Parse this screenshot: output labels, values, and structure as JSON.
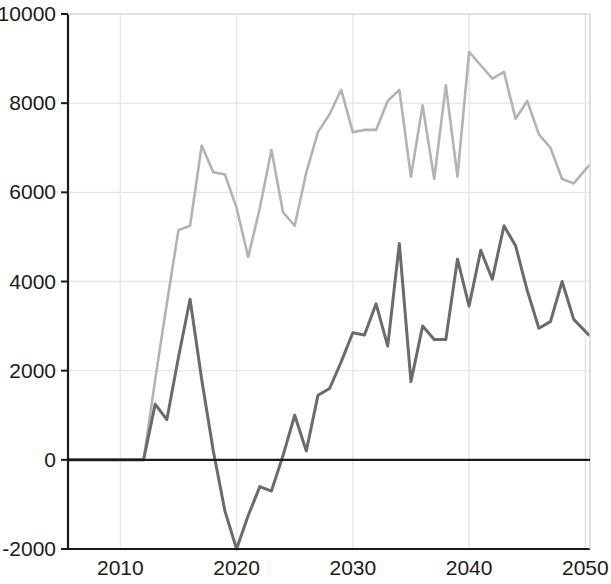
{
  "chart_data": {
    "type": "line",
    "title": "",
    "subtitle": "",
    "xlabel": "",
    "ylabel": "",
    "xlim": [
      2005.5,
      2050.4
    ],
    "ylim": [
      -2000,
      10000
    ],
    "grid": true,
    "legend": "none",
    "x_ticks": [
      "2010",
      "2020",
      "2030",
      "2040",
      "2050"
    ],
    "x_tick_values": [
      2010,
      2020,
      2030,
      2040,
      2050
    ],
    "y_ticks": [
      "10000",
      "8000",
      "6000",
      "4000",
      "2000",
      "0",
      "-2000"
    ],
    "y_tick_values": [
      10000,
      8000,
      6000,
      4000,
      2000,
      0,
      -2000
    ],
    "colors": {
      "upper_series": "#b3b3b3",
      "lower_series": "#6b6b6b",
      "axis": "#1a1a1a",
      "grid": "#e6e6e6",
      "background": "#ffffff"
    },
    "series": [
      {
        "name": "upper-series",
        "color": "#b3b3b3",
        "line_width": 2.6,
        "x": [
          2005.5,
          2006,
          2007,
          2008,
          2009,
          2010,
          2011,
          2012,
          2013,
          2014,
          2015,
          2016,
          2017,
          2018,
          2019,
          2020,
          2021,
          2022,
          2023,
          2024,
          2025,
          2026,
          2027,
          2028,
          2029,
          2030,
          2031,
          2032,
          2033,
          2034,
          2035,
          2036,
          2037,
          2038,
          2039,
          2040,
          2041,
          2042,
          2043,
          2044,
          2045,
          2046,
          2047,
          2048,
          2049,
          2050.3
        ],
        "values": [
          0,
          0,
          0,
          0,
          0,
          0,
          0,
          0,
          1800,
          3500,
          5150,
          5250,
          7050,
          6450,
          6400,
          5650,
          4550,
          5650,
          6950,
          5550,
          5250,
          6450,
          7350,
          7750,
          8300,
          7350,
          7400,
          7400,
          8050,
          8300,
          6350,
          7950,
          6300,
          8400,
          6350,
          9150,
          8850,
          8550,
          8700,
          7650,
          8050,
          7300,
          7000,
          6300,
          6200,
          6600
        ]
      },
      {
        "name": "lower-series",
        "color": "#6b6b6b",
        "line_width": 3.0,
        "x": [
          2005.5,
          2006,
          2007,
          2008,
          2009,
          2010,
          2011,
          2012,
          2013,
          2014,
          2015,
          2016,
          2017,
          2018,
          2019,
          2020,
          2021,
          2022,
          2023,
          2024,
          2025,
          2026,
          2027,
          2028,
          2029,
          2030,
          2031,
          2032,
          2033,
          2034,
          2035,
          2036,
          2037,
          2038,
          2039,
          2040,
          2041,
          2042,
          2043,
          2044,
          2045,
          2046,
          2047,
          2048,
          2049,
          2050.3
        ],
        "values": [
          0,
          0,
          0,
          0,
          0,
          0,
          0,
          0,
          1250,
          900,
          2300,
          3600,
          1800,
          200,
          -1150,
          -2000,
          -1250,
          -600,
          -700,
          100,
          1000,
          200,
          1450,
          1600,
          2200,
          2850,
          2800,
          3500,
          2550,
          4850,
          1750,
          3000,
          2700,
          2700,
          4500,
          3450,
          4700,
          4050,
          5250,
          4800,
          3800,
          2950,
          3100,
          4000,
          3150,
          2800
        ]
      }
    ]
  }
}
